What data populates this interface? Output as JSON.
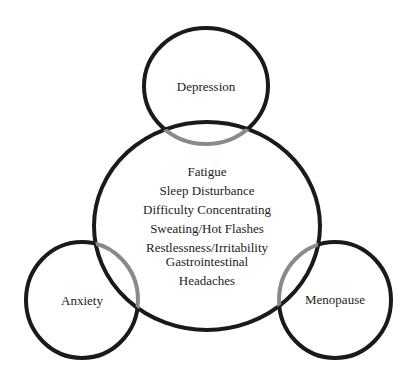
{
  "diagram": {
    "type": "venn-overlap",
    "center_circle": {
      "items": [
        "Fatigue",
        "Sleep Disturbance",
        "Difficulty Concentrating",
        "Sweating/Hot Flashes",
        "Restlessness/Irritability",
        "Gastrointestinal",
        "Headaches"
      ]
    },
    "outer_circles": [
      {
        "label": "Depression"
      },
      {
        "label": "Anxiety"
      },
      {
        "label": "Menopause"
      }
    ],
    "colors": {
      "stroke": "#1a1a1a",
      "overlap_stroke": "#8a8a8a",
      "text": "#222222",
      "background": "#ffffff"
    }
  }
}
